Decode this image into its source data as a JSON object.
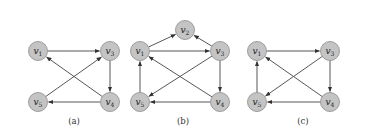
{
  "figure": {
    "node_color": "#c4c4c4",
    "edge_color": "#444444",
    "graphs": [
      {
        "caption": "(a)",
        "nodes": [
          {
            "id": "v1",
            "label": "v",
            "sub": "1",
            "x": 38,
            "y": 51
          },
          {
            "id": "v3",
            "label": "v",
            "sub": "3",
            "x": 110,
            "y": 51
          },
          {
            "id": "v5",
            "label": "v",
            "sub": "5",
            "x": 38,
            "y": 102
          },
          {
            "id": "v4",
            "label": "v",
            "sub": "4",
            "x": 110,
            "y": 102
          }
        ],
        "edges": [
          {
            "from": "v1",
            "to": "v3"
          },
          {
            "from": "v3",
            "to": "v4"
          },
          {
            "from": "v4",
            "to": "v5"
          },
          {
            "from": "v4",
            "to": "v1"
          },
          {
            "from": "v5",
            "to": "v3"
          }
        ],
        "caption_x": 74
      },
      {
        "caption": "(b)",
        "nodes": [
          {
            "id": "v2",
            "label": "v",
            "sub": "2",
            "x": 185,
            "y": 30
          },
          {
            "id": "v1",
            "label": "v",
            "sub": "1",
            "x": 140,
            "y": 51
          },
          {
            "id": "v3",
            "label": "v",
            "sub": "3",
            "x": 220,
            "y": 51
          },
          {
            "id": "v5",
            "label": "v",
            "sub": "5",
            "x": 140,
            "y": 102
          },
          {
            "id": "v4",
            "label": "v",
            "sub": "4",
            "x": 220,
            "y": 102
          }
        ],
        "edges": [
          {
            "from": "v1",
            "to": "v2"
          },
          {
            "from": "v3",
            "to": "v2"
          },
          {
            "from": "v1",
            "to": "v3"
          },
          {
            "from": "v3",
            "to": "v4"
          },
          {
            "from": "v3",
            "to": "v5"
          },
          {
            "from": "v4",
            "to": "v1"
          },
          {
            "from": "v4",
            "to": "v5"
          },
          {
            "from": "v5",
            "to": "v1"
          }
        ],
        "caption_x": 183
      },
      {
        "caption": "(c)",
        "nodes": [
          {
            "id": "v1",
            "label": "v",
            "sub": "1",
            "x": 257,
            "y": 51
          },
          {
            "id": "v3",
            "label": "v",
            "sub": "3",
            "x": 330,
            "y": 51
          },
          {
            "id": "v5",
            "label": "v",
            "sub": "5",
            "x": 257,
            "y": 102
          },
          {
            "id": "v4",
            "label": "v",
            "sub": "4",
            "x": 330,
            "y": 102
          }
        ],
        "edges": [
          {
            "from": "v1",
            "to": "v3"
          },
          {
            "from": "v3",
            "to": "v4"
          },
          {
            "from": "v3",
            "to": "v5"
          },
          {
            "from": "v4",
            "to": "v1"
          },
          {
            "from": "v4",
            "to": "v5"
          },
          {
            "from": "v5",
            "to": "v1"
          }
        ],
        "caption_x": 303
      }
    ]
  }
}
